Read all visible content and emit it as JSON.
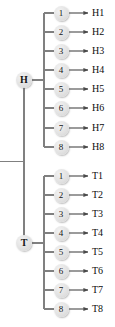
{
  "diagram": {
    "type": "tree",
    "title": "",
    "background_color": "#ffffff",
    "node_fill_color": "#e2e2e2",
    "line_color": "#808080",
    "text_color": "#0d0d0d",
    "root_stub": {
      "present": true
    },
    "groups": [
      {
        "id": "H",
        "root_label": "H",
        "root_x": 24,
        "root_y": 80,
        "bracket_x": 44,
        "children": [
          {
            "index_label": "1",
            "leaf_label": "H1",
            "y": 13
          },
          {
            "index_label": "2",
            "leaf_label": "H2",
            "y": 32
          },
          {
            "index_label": "3",
            "leaf_label": "H3",
            "y": 51
          },
          {
            "index_label": "4",
            "leaf_label": "H4",
            "y": 70
          },
          {
            "index_label": "5",
            "leaf_label": "H5",
            "y": 89
          },
          {
            "index_label": "6",
            "leaf_label": "H6",
            "y": 108
          },
          {
            "index_label": "7",
            "leaf_label": "H7",
            "y": 128
          },
          {
            "index_label": "8",
            "leaf_label": "H8",
            "y": 147
          }
        ]
      },
      {
        "id": "T",
        "root_label": "T",
        "root_x": 24,
        "root_y": 243,
        "bracket_x": 44,
        "children": [
          {
            "index_label": "1",
            "leaf_label": "T1",
            "y": 176
          },
          {
            "index_label": "2",
            "leaf_label": "T2",
            "y": 195
          },
          {
            "index_label": "3",
            "leaf_label": "T3",
            "y": 214
          },
          {
            "index_label": "4",
            "leaf_label": "T4",
            "y": 233
          },
          {
            "index_label": "5",
            "leaf_label": "T5",
            "y": 252
          },
          {
            "index_label": "6",
            "leaf_label": "T6",
            "y": 271
          },
          {
            "index_label": "7",
            "leaf_label": "T7",
            "y": 290
          },
          {
            "index_label": "8",
            "leaf_label": "T8",
            "y": 309
          }
        ]
      }
    ]
  }
}
